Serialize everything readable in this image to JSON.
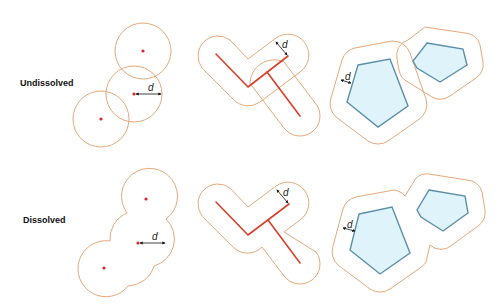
{
  "rows": [
    {
      "label": "Undissolved"
    },
    {
      "label": "Dissolved"
    }
  ],
  "distance_label": "d",
  "colors": {
    "buffer_outline": "#e8a878",
    "feature_point": "#d42a2a",
    "feature_line": "#d8402a",
    "polygon_fill": "#dff3fa",
    "polygon_outline": "#5b8fa8",
    "arrow": "#111111"
  },
  "panels": [
    {
      "type": "point-buffer",
      "row": "Undissolved"
    },
    {
      "type": "line-buffer",
      "row": "Undissolved"
    },
    {
      "type": "polygon-buffer",
      "row": "Undissolved"
    },
    {
      "type": "point-buffer",
      "row": "Dissolved"
    },
    {
      "type": "line-buffer",
      "row": "Dissolved"
    },
    {
      "type": "polygon-buffer",
      "row": "Dissolved"
    }
  ]
}
